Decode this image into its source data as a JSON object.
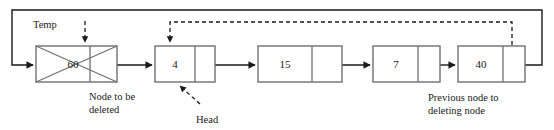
{
  "diagram": {
    "colors": {
      "node_stroke": "#6f6f6f",
      "line": "#1a1a1a",
      "text": "#1a1a1a",
      "background": "#ffffff"
    },
    "nodes": [
      {
        "id": "node-60",
        "value": "60",
        "deleted": true,
        "x": 36,
        "y": 46,
        "w": 81,
        "h": 36,
        "divider_x": 90
      },
      {
        "id": "node-4",
        "value": "4",
        "deleted": false,
        "x": 155,
        "y": 46,
        "w": 60,
        "h": 36,
        "divider_x": 195
      },
      {
        "id": "node-15",
        "value": "15",
        "deleted": false,
        "x": 258,
        "y": 46,
        "w": 84,
        "h": 36,
        "divider_x": 312
      },
      {
        "id": "node-7",
        "value": "7",
        "deleted": false,
        "x": 373,
        "y": 46,
        "w": 67,
        "h": 36,
        "divider_x": 418
      },
      {
        "id": "node-40",
        "value": "40",
        "deleted": false,
        "x": 458,
        "y": 46,
        "w": 67,
        "h": 36,
        "divider_x": 503
      }
    ],
    "labels": {
      "temp": "Temp",
      "head": "Head",
      "node_to_be_deleted_line1": "Node to be",
      "node_to_be_deleted_line2": "deleted",
      "previous_node_line1": "Previous node to",
      "previous_node_line2": "deleting node"
    }
  }
}
